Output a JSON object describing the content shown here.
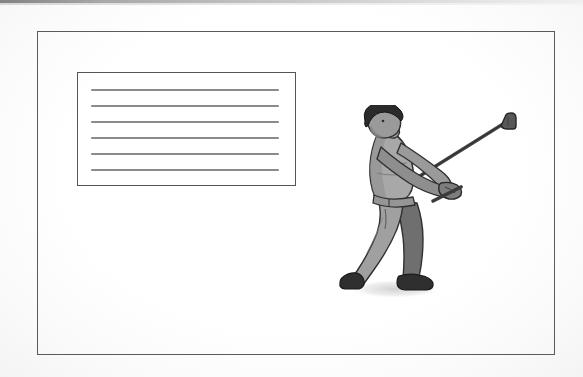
{
  "page": {
    "background_color": "#fdfdfd",
    "frame_color": "#5a5a5a"
  },
  "outer_frame": {
    "name": "page-border",
    "x": 37,
    "y": 31,
    "width": 518,
    "height": 324,
    "border_color": "#5a5a5a",
    "border_width": 1.6
  },
  "note_box": {
    "name": "lined-text-box",
    "x": 77,
    "y": 72,
    "width": 219,
    "height": 114,
    "border_color": "#555555",
    "line_color": "#8a8a8a",
    "line_count": 6,
    "lines": [
      "",
      "",
      "",
      "",
      "",
      ""
    ],
    "text_content": ""
  },
  "illustration": {
    "name": "golfer-swing-illustration",
    "subject": "golfer",
    "pose": "follow-through of golf swing",
    "x": 337,
    "y": 105,
    "width": 190,
    "height": 195,
    "style": "grayscale halftone line art",
    "colors": {
      "hair": "#2b2b2b",
      "skin": "#9a9a9a",
      "shirt": "#a8a8a8",
      "shirt_shadow": "#8c8c8c",
      "pants_light": "#a0a0a0",
      "pants_dark": "#6f6f6f",
      "shoes": "#2f2f2f",
      "club": "#4a4a4a",
      "outline": "#3a3a3a",
      "ground_shadow": "#dcdcdc"
    },
    "parts": [
      "head",
      "hair",
      "neck",
      "torso",
      "left-arm",
      "right-arm",
      "hands",
      "belt",
      "left-leg",
      "right-leg",
      "left-shoe",
      "right-shoe",
      "golf-club-shaft",
      "golf-club-head",
      "ground-shadow"
    ]
  },
  "scan_artifact": {
    "name": "scanner-edge-band",
    "description": "dark gray band along top edge of scan",
    "color": "#6e6e6e"
  }
}
